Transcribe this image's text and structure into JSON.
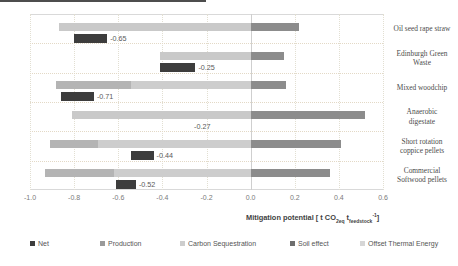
{
  "chart_data": {
    "type": "bar",
    "title": "",
    "subtitle": "",
    "orientation": "horizontal",
    "stacked": true,
    "xlabel": "Mitigation potential [ t CO2eq tfeedstock -1 ]",
    "xlabel_parts": {
      "main": "Mitigation potential [ t CO",
      "sub1": "2eq",
      "mid": " t",
      "sub2": "feedstock",
      "sup": "-1",
      "end": "]"
    },
    "ylabel": "",
    "xlim": [
      -1.0,
      0.6
    ],
    "xticks": [
      "-1.0",
      "-0.8",
      "-0.6",
      "-0.4",
      "-0.2",
      "0.0",
      "0.2",
      "0.4",
      "0.6"
    ],
    "xtick_values": [
      -1.0,
      -0.8,
      -0.6,
      -0.4,
      -0.2,
      0.0,
      0.2,
      0.4,
      0.6
    ],
    "grid": true,
    "legend_position": "bottom",
    "categories": [
      "Oil seed rape straw",
      "Edinburgh Green Waste",
      "Mixed woodchip",
      "Anaerobic digestate",
      "Short rotation coppice pellets",
      "Commercial Softwood pellets"
    ],
    "category_lines": [
      [
        "Oil seed rape straw"
      ],
      [
        "Edinburgh Green",
        "Waste"
      ],
      [
        "Mixed woodchip"
      ],
      [
        "Anaerobic",
        "digestate"
      ],
      [
        "Short rotation",
        "coppice pellets"
      ],
      [
        "Commercial",
        "Softwood pellets"
      ]
    ],
    "series": [
      {
        "name": "Net",
        "color": "#3d3d3d",
        "values": [
          -0.65,
          -0.25,
          -0.71,
          -0.27,
          -0.44,
          -0.52
        ],
        "labels": [
          "-0.65",
          "-0.25",
          "-0.71",
          "-0.27",
          "-0.44",
          "-0.52"
        ],
        "label_starts": [
          -0.8,
          -0.41,
          -0.86,
          -0.27,
          -0.54,
          -0.61
        ]
      },
      {
        "name": "Production",
        "color": "#9a9a9a",
        "values": [
          0.0,
          0.0,
          0.0,
          0.0,
          0.0,
          0.0
        ]
      },
      {
        "name": "Carbon Sequestration",
        "color": "#c8c8c8",
        "values": [
          -0.87,
          -0.41,
          -0.88,
          -0.81,
          -0.91,
          -0.93
        ]
      },
      {
        "name": "Soil effect",
        "color": "#6e6e6e",
        "values": [
          0.0,
          0.0,
          0.0,
          0.0,
          0.0,
          0.0
        ]
      },
      {
        "name": "Offset Thermal Energy",
        "color": "#8c8c8c",
        "values": [
          0.22,
          0.15,
          0.16,
          0.52,
          0.41,
          0.36
        ]
      }
    ],
    "stack_segments": [
      {
        "category": "Oil seed rape straw",
        "negative": [
          {
            "series": "Carbon Sequestration",
            "from": -0.87,
            "to": 0.0,
            "color": "#c9c9c9"
          }
        ],
        "positive": [
          {
            "series": "Offset Thermal Energy",
            "from": 0.0,
            "to": 0.22,
            "color": "#8c8c8c"
          }
        ]
      },
      {
        "category": "Edinburgh Green Waste",
        "negative": [
          {
            "series": "Carbon Sequestration",
            "from": -0.41,
            "to": 0.0,
            "color": "#c9c9c9"
          }
        ],
        "positive": [
          {
            "series": "Offset Thermal Energy",
            "from": 0.0,
            "to": 0.15,
            "color": "#8c8c8c"
          }
        ]
      },
      {
        "category": "Mixed woodchip",
        "negative": [
          {
            "series": "Production",
            "from": -0.88,
            "to": -0.54,
            "color": "#b4b4b4"
          },
          {
            "series": "Carbon Sequestration",
            "from": -0.54,
            "to": 0.0,
            "color": "#cdcdcd"
          }
        ],
        "positive": [
          {
            "series": "Offset Thermal Energy",
            "from": 0.0,
            "to": 0.16,
            "color": "#8c8c8c"
          }
        ]
      },
      {
        "category": "Anaerobic digestate",
        "negative": [
          {
            "series": "Carbon Sequestration",
            "from": -0.81,
            "to": 0.0,
            "color": "#c9c9c9"
          }
        ],
        "positive": [
          {
            "series": "Offset Thermal Energy",
            "from": 0.0,
            "to": 0.52,
            "color": "#8c8c8c"
          }
        ]
      },
      {
        "category": "Short rotation coppice pellets",
        "negative": [
          {
            "series": "Production",
            "from": -0.91,
            "to": -0.69,
            "color": "#b4b4b4"
          },
          {
            "series": "Carbon Sequestration",
            "from": -0.69,
            "to": 0.0,
            "color": "#cdcdcd"
          }
        ],
        "positive": [
          {
            "series": "Offset Thermal Energy",
            "from": 0.0,
            "to": 0.41,
            "color": "#8c8c8c"
          }
        ]
      },
      {
        "category": "Commercial Softwood pellets",
        "negative": [
          {
            "series": "Production",
            "from": -0.93,
            "to": -0.62,
            "color": "#b4b4b4"
          },
          {
            "series": "Carbon Sequestration",
            "from": -0.62,
            "to": 0.0,
            "color": "#cdcdcd"
          }
        ],
        "positive": [
          {
            "series": "Offset Thermal Energy",
            "from": 0.0,
            "to": 0.36,
            "color": "#8c8c8c"
          }
        ]
      }
    ],
    "legend": [
      {
        "label": "Net",
        "color": "#3d3d3d"
      },
      {
        "label": "Production",
        "color": "#9a9a9a"
      },
      {
        "label": "Carbon Sequestration",
        "color": "#cdcdcd"
      },
      {
        "label": "Soil effect",
        "color": "#6e6e6e"
      },
      {
        "label": "Offset Thermal Energy",
        "color": "#d6d6d6"
      }
    ]
  }
}
